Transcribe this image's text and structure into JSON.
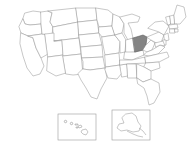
{
  "map": {
    "title": "United States map",
    "description": "Outline map of the United States with one state shaded",
    "background_color": "#ffffff",
    "border_color": "#9a9a9a",
    "state_fill_color": "#ffffff",
    "highlight_fill_color": "#848484",
    "highlight_border_color": "#5a5a5a",
    "highlighted_states": [
      "Ohio"
    ],
    "projection_note": "contiguous states with Alaska and Hawaii insets"
  },
  "insets": {
    "hawaii": {
      "name": "Hawaii",
      "box": {
        "x": 58,
        "y": 114,
        "width": 38,
        "height": 26
      },
      "island_count": 8
    },
    "alaska": {
      "name": "Alaska",
      "box": {
        "x": 112,
        "y": 110,
        "width": 38,
        "height": 30
      }
    }
  },
  "states": [
    {
      "code": "WA",
      "name": "Washington",
      "highlighted": false
    },
    {
      "code": "OR",
      "name": "Oregon",
      "highlighted": false
    },
    {
      "code": "CA",
      "name": "California",
      "highlighted": false
    },
    {
      "code": "NV",
      "name": "Nevada",
      "highlighted": false
    },
    {
      "code": "ID",
      "name": "Idaho",
      "highlighted": false
    },
    {
      "code": "MT",
      "name": "Montana",
      "highlighted": false
    },
    {
      "code": "WY",
      "name": "Wyoming",
      "highlighted": false
    },
    {
      "code": "UT",
      "name": "Utah",
      "highlighted": false
    },
    {
      "code": "AZ",
      "name": "Arizona",
      "highlighted": false
    },
    {
      "code": "CO",
      "name": "Colorado",
      "highlighted": false
    },
    {
      "code": "NM",
      "name": "New Mexico",
      "highlighted": false
    },
    {
      "code": "ND",
      "name": "North Dakota",
      "highlighted": false
    },
    {
      "code": "SD",
      "name": "South Dakota",
      "highlighted": false
    },
    {
      "code": "NE",
      "name": "Nebraska",
      "highlighted": false
    },
    {
      "code": "KS",
      "name": "Kansas",
      "highlighted": false
    },
    {
      "code": "OK",
      "name": "Oklahoma",
      "highlighted": false
    },
    {
      "code": "TX",
      "name": "Texas",
      "highlighted": false
    },
    {
      "code": "MN",
      "name": "Minnesota",
      "highlighted": false
    },
    {
      "code": "IA",
      "name": "Iowa",
      "highlighted": false
    },
    {
      "code": "MO",
      "name": "Missouri",
      "highlighted": false
    },
    {
      "code": "AR",
      "name": "Arkansas",
      "highlighted": false
    },
    {
      "code": "LA",
      "name": "Louisiana",
      "highlighted": false
    },
    {
      "code": "WI",
      "name": "Wisconsin",
      "highlighted": false
    },
    {
      "code": "IL",
      "name": "Illinois",
      "highlighted": false
    },
    {
      "code": "MS",
      "name": "Mississippi",
      "highlighted": false
    },
    {
      "code": "MI",
      "name": "Michigan",
      "highlighted": false
    },
    {
      "code": "IN",
      "name": "Indiana",
      "highlighted": false
    },
    {
      "code": "KY",
      "name": "Kentucky",
      "highlighted": false
    },
    {
      "code": "TN",
      "name": "Tennessee",
      "highlighted": false
    },
    {
      "code": "AL",
      "name": "Alabama",
      "highlighted": false
    },
    {
      "code": "OH",
      "name": "Ohio",
      "highlighted": true
    },
    {
      "code": "WV",
      "name": "West Virginia",
      "highlighted": false
    },
    {
      "code": "VA",
      "name": "Virginia",
      "highlighted": false
    },
    {
      "code": "NC",
      "name": "North Carolina",
      "highlighted": false
    },
    {
      "code": "SC",
      "name": "South Carolina",
      "highlighted": false
    },
    {
      "code": "GA",
      "name": "Georgia",
      "highlighted": false
    },
    {
      "code": "FL",
      "name": "Florida",
      "highlighted": false
    },
    {
      "code": "PA",
      "name": "Pennsylvania",
      "highlighted": false
    },
    {
      "code": "NY",
      "name": "New York",
      "highlighted": false
    },
    {
      "code": "VT",
      "name": "Vermont",
      "highlighted": false
    },
    {
      "code": "NH",
      "name": "New Hampshire",
      "highlighted": false
    },
    {
      "code": "ME",
      "name": "Maine",
      "highlighted": false
    },
    {
      "code": "MA",
      "name": "Massachusetts",
      "highlighted": false
    },
    {
      "code": "CT",
      "name": "Connecticut",
      "highlighted": false
    },
    {
      "code": "RI",
      "name": "Rhode Island",
      "highlighted": false
    },
    {
      "code": "NJ",
      "name": "New Jersey",
      "highlighted": false
    },
    {
      "code": "DE",
      "name": "Delaware",
      "highlighted": false
    },
    {
      "code": "MD",
      "name": "Maryland",
      "highlighted": false
    },
    {
      "code": "AK",
      "name": "Alaska",
      "highlighted": false
    },
    {
      "code": "HI",
      "name": "Hawaii",
      "highlighted": false
    }
  ]
}
